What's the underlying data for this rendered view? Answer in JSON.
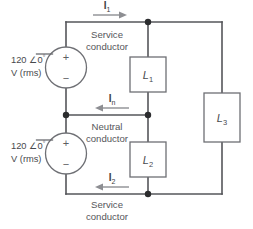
{
  "figure": {
    "background_color": "#ffffff",
    "wire_color": "#55565a",
    "node_color": "#2b2c2e",
    "arrow_color": "#8d8e92",
    "text_color": "#55565a"
  },
  "sources": {
    "upper": {
      "magnitude": "120",
      "angle_symbol": "∠",
      "angle": "0",
      "degree": "°",
      "unit": "V (rms)",
      "plus": "+",
      "minus": "−"
    },
    "lower": {
      "magnitude": "120",
      "angle_symbol": "∠",
      "angle": "0",
      "degree": "°",
      "unit": "V (rms)",
      "plus": "+",
      "minus": "−"
    }
  },
  "conductors": {
    "top": {
      "name_line1": "Service",
      "name_line2": "conductor",
      "current_symbol": "I",
      "current_subscript": "1",
      "arrow_direction": "right"
    },
    "middle": {
      "name_line1": "Neutral",
      "name_line2": "conductor",
      "current_symbol": "I",
      "current_subscript": "n",
      "arrow_direction": "left"
    },
    "bottom": {
      "name_line1": "Service",
      "name_line2": "conductor",
      "current_symbol": "I",
      "current_subscript": "2",
      "arrow_direction": "left"
    }
  },
  "loads": [
    {
      "symbol": "L",
      "subscript": "1",
      "position": "upper-center"
    },
    {
      "symbol": "L",
      "subscript": "2",
      "position": "lower-center"
    },
    {
      "symbol": "L",
      "subscript": "3",
      "position": "right"
    }
  ],
  "nodes": [
    {
      "id": "top-junction",
      "x": 148,
      "y": 22
    },
    {
      "id": "neutral-left-junction",
      "x": 66,
      "y": 115
    },
    {
      "id": "neutral-right-junction",
      "x": 148,
      "y": 115
    },
    {
      "id": "bottom-junction",
      "x": 148,
      "y": 194
    }
  ]
}
